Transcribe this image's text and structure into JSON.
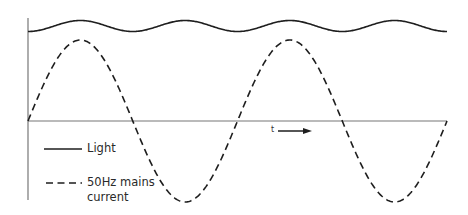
{
  "diagram": {
    "title": "",
    "axes": {
      "time_label": "t",
      "time_arrow": "right",
      "origin": {
        "x": 28,
        "y": 121
      },
      "x_axis_end": 447,
      "y_axis_top": 18,
      "y_axis_bottom": 200,
      "axis_color": "#777777"
    },
    "legend": {
      "items": [
        {
          "label": "Light",
          "style": "solid"
        },
        {
          "label_line1": "50Hz mains",
          "label_line2": "current",
          "style": "dashed"
        }
      ]
    },
    "colors": {
      "curve": "#1e1e1e",
      "axis": "#777777",
      "text": "#2a2a2a",
      "background": "#ffffff"
    }
  },
  "chart_data": {
    "type": "line",
    "title": "",
    "xlabel": "t",
    "ylabel": "",
    "grid": false,
    "legend_position": "bottom-left inside",
    "series": [
      {
        "name": "Light",
        "style": "solid",
        "description": "Small-amplitude ripple at twice the mains frequency (100 Hz), riding on a high constant level; peaks coincide with current peaks and troughs, minima coincide with current zero-crossings",
        "relative_frequency": 2,
        "cycles_shown": 4,
        "offset_level_px": 26,
        "amplitude_px": 5.5
      },
      {
        "name": "50Hz mains current",
        "style": "dashed",
        "description": "Sinusoid starting at zero and rising, two full cycles shown",
        "relative_frequency": 1,
        "cycles_shown": 2,
        "amplitude_px": 81,
        "zero_crossings_x_px": [
          28,
          133,
          239,
          343,
          447
        ],
        "peaks_x_px": [
          80,
          290
        ],
        "troughs_x_px": [
          187,
          396
        ]
      }
    ]
  }
}
